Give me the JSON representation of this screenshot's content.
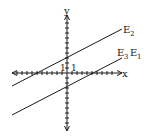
{
  "figure": {
    "axes": {
      "x_label": "x",
      "y_label": "y",
      "unit_label_x": "1",
      "unit_label_y": "1"
    },
    "lines": [
      {
        "name": "E2",
        "label_main": "E",
        "label_sub": "2",
        "y_intercept_units": 3
      },
      {
        "name": "E3 E1",
        "label_main_a": "E",
        "label_sub_a": "3",
        "label_main_b": "E",
        "label_sub_b": "1",
        "y_intercept_units": -3
      }
    ],
    "colors": {
      "ink": "#1a1a1a",
      "background": "#ffffff"
    }
  }
}
